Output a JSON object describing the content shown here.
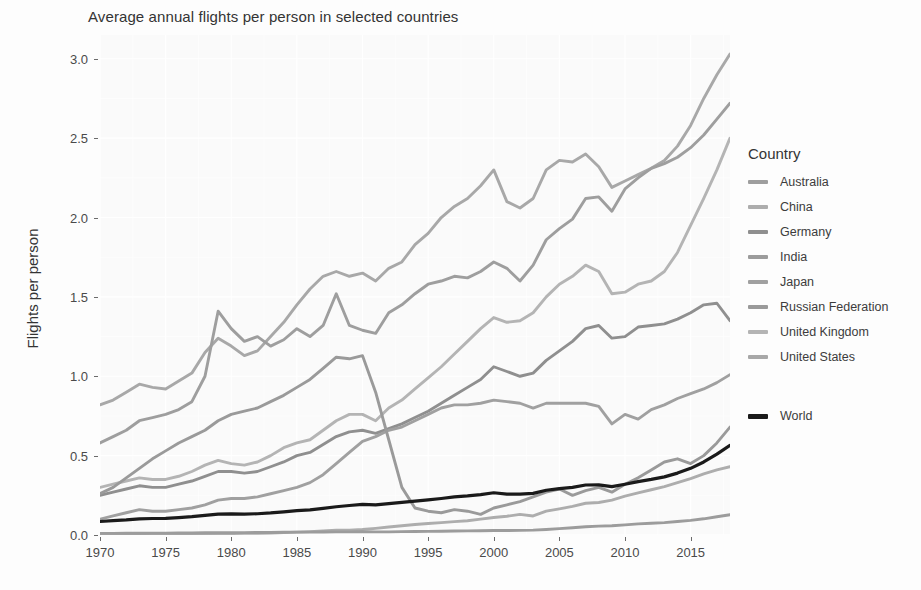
{
  "chart_data": {
    "type": "line",
    "title": "Average annual flights per person in selected countries",
    "xlabel": "",
    "ylabel": "Flights per person",
    "xlim": [
      1970,
      2018
    ],
    "ylim": [
      0.0,
      3.15
    ],
    "x_ticks": [
      1970,
      1975,
      1980,
      1985,
      1990,
      1995,
      2000,
      2005,
      2010,
      2015
    ],
    "y_ticks": [
      "0.0",
      "0.5",
      "1.0",
      "1.5",
      "2.0",
      "2.5",
      "3.0"
    ],
    "grid": true,
    "legend_position": "right",
    "legend_title": "Country",
    "x": [
      1970,
      1971,
      1972,
      1973,
      1974,
      1975,
      1976,
      1977,
      1978,
      1979,
      1980,
      1981,
      1982,
      1983,
      1984,
      1985,
      1986,
      1987,
      1988,
      1989,
      1990,
      1991,
      1992,
      1993,
      1994,
      1995,
      1996,
      1997,
      1998,
      1999,
      2000,
      2001,
      2002,
      2003,
      2004,
      2005,
      2006,
      2007,
      2008,
      2009,
      2010,
      2011,
      2012,
      2013,
      2014,
      2015,
      2016,
      2017,
      2018
    ],
    "series": [
      {
        "name": "United States",
        "color": "#a8a8a8",
        "values": [
          0.82,
          0.85,
          0.9,
          0.95,
          0.93,
          0.92,
          0.97,
          1.02,
          1.15,
          1.24,
          1.19,
          1.13,
          1.16,
          1.25,
          1.34,
          1.45,
          1.55,
          1.63,
          1.66,
          1.63,
          1.65,
          1.6,
          1.68,
          1.72,
          1.83,
          1.9,
          2.0,
          2.07,
          2.12,
          2.2,
          2.3,
          2.1,
          2.06,
          2.12,
          2.3,
          2.36,
          2.35,
          2.4,
          2.32,
          2.19,
          2.23,
          2.27,
          2.31,
          2.36,
          2.45,
          2.58,
          2.75,
          2.9,
          3.03
        ]
      },
      {
        "name": "Australia",
        "color": "#9e9e9e",
        "values": [
          0.58,
          0.62,
          0.66,
          0.72,
          0.74,
          0.76,
          0.79,
          0.84,
          1.0,
          1.41,
          1.3,
          1.22,
          1.25,
          1.19,
          1.23,
          1.3,
          1.25,
          1.32,
          1.52,
          1.32,
          1.29,
          1.27,
          1.4,
          1.45,
          1.52,
          1.58,
          1.6,
          1.63,
          1.62,
          1.66,
          1.72,
          1.68,
          1.6,
          1.7,
          1.86,
          1.93,
          1.99,
          2.12,
          2.13,
          2.04,
          2.18,
          2.25,
          2.31,
          2.34,
          2.38,
          2.44,
          2.52,
          2.62,
          2.72
        ]
      },
      {
        "name": "United Kingdom",
        "color": "#b4b4b4",
        "values": [
          0.3,
          0.32,
          0.34,
          0.36,
          0.35,
          0.35,
          0.37,
          0.4,
          0.44,
          0.47,
          0.45,
          0.44,
          0.46,
          0.5,
          0.55,
          0.58,
          0.6,
          0.66,
          0.72,
          0.76,
          0.76,
          0.72,
          0.8,
          0.85,
          0.92,
          0.99,
          1.06,
          1.14,
          1.22,
          1.3,
          1.37,
          1.34,
          1.35,
          1.4,
          1.5,
          1.58,
          1.63,
          1.7,
          1.66,
          1.52,
          1.53,
          1.58,
          1.6,
          1.66,
          1.78,
          1.95,
          2.12,
          2.3,
          2.5
        ]
      },
      {
        "name": "Germany",
        "color": "#8f8f8f",
        "values": [
          0.25,
          0.27,
          0.29,
          0.31,
          0.3,
          0.3,
          0.32,
          0.34,
          0.37,
          0.4,
          0.4,
          0.39,
          0.4,
          0.43,
          0.46,
          0.5,
          0.52,
          0.57,
          0.62,
          0.65,
          0.66,
          0.64,
          0.67,
          0.7,
          0.74,
          0.78,
          0.83,
          0.88,
          0.93,
          0.98,
          1.06,
          1.03,
          1.0,
          1.02,
          1.1,
          1.16,
          1.22,
          1.3,
          1.32,
          1.24,
          1.25,
          1.31,
          1.32,
          1.33,
          1.36,
          1.4,
          1.45,
          1.46,
          1.35
        ]
      },
      {
        "name": "Japan",
        "color": "#a0a0a0",
        "values": [
          0.1,
          0.12,
          0.14,
          0.16,
          0.15,
          0.15,
          0.16,
          0.17,
          0.19,
          0.22,
          0.23,
          0.23,
          0.24,
          0.26,
          0.28,
          0.3,
          0.33,
          0.38,
          0.45,
          0.52,
          0.59,
          0.62,
          0.66,
          0.68,
          0.72,
          0.76,
          0.8,
          0.82,
          0.82,
          0.83,
          0.85,
          0.84,
          0.83,
          0.8,
          0.83,
          0.83,
          0.83,
          0.83,
          0.81,
          0.7,
          0.76,
          0.73,
          0.79,
          0.82,
          0.86,
          0.89,
          0.92,
          0.96,
          1.01
        ]
      },
      {
        "name": "Russian Federation",
        "color": "#9a9a9a",
        "values": [
          0.26,
          0.3,
          0.36,
          0.42,
          0.48,
          0.53,
          0.58,
          0.62,
          0.66,
          0.72,
          0.76,
          0.78,
          0.8,
          0.84,
          0.88,
          0.93,
          0.98,
          1.05,
          1.12,
          1.11,
          1.13,
          0.9,
          0.6,
          0.3,
          0.17,
          0.15,
          0.14,
          0.16,
          0.15,
          0.13,
          0.17,
          0.19,
          0.21,
          0.24,
          0.27,
          0.29,
          0.25,
          0.28,
          0.3,
          0.27,
          0.32,
          0.36,
          0.41,
          0.46,
          0.48,
          0.45,
          0.5,
          0.58,
          0.68
        ]
      },
      {
        "name": "China",
        "color": "#adadad",
        "values": [
          0.002,
          0.002,
          0.003,
          0.003,
          0.004,
          0.004,
          0.005,
          0.006,
          0.007,
          0.008,
          0.009,
          0.01,
          0.011,
          0.013,
          0.015,
          0.018,
          0.021,
          0.025,
          0.03,
          0.03,
          0.035,
          0.042,
          0.05,
          0.058,
          0.066,
          0.072,
          0.078,
          0.084,
          0.09,
          0.1,
          0.11,
          0.118,
          0.13,
          0.12,
          0.15,
          0.165,
          0.18,
          0.2,
          0.205,
          0.22,
          0.245,
          0.265,
          0.285,
          0.305,
          0.33,
          0.355,
          0.385,
          0.41,
          0.43
        ]
      },
      {
        "name": "India",
        "color": "#9c9c9c",
        "values": [
          0.01,
          0.01,
          0.011,
          0.011,
          0.012,
          0.012,
          0.013,
          0.013,
          0.014,
          0.015,
          0.015,
          0.015,
          0.016,
          0.016,
          0.017,
          0.018,
          0.018,
          0.019,
          0.02,
          0.02,
          0.021,
          0.02,
          0.02,
          0.021,
          0.022,
          0.023,
          0.024,
          0.025,
          0.026,
          0.027,
          0.028,
          0.028,
          0.029,
          0.031,
          0.035,
          0.04,
          0.046,
          0.052,
          0.056,
          0.058,
          0.064,
          0.07,
          0.074,
          0.078,
          0.085,
          0.092,
          0.102,
          0.115,
          0.128
        ]
      },
      {
        "name": "World",
        "color": "#1a1a1a",
        "values": [
          0.085,
          0.09,
          0.095,
          0.102,
          0.104,
          0.105,
          0.11,
          0.116,
          0.124,
          0.132,
          0.133,
          0.132,
          0.134,
          0.139,
          0.146,
          0.153,
          0.158,
          0.168,
          0.178,
          0.186,
          0.193,
          0.19,
          0.198,
          0.205,
          0.213,
          0.221,
          0.23,
          0.24,
          0.246,
          0.254,
          0.266,
          0.258,
          0.258,
          0.262,
          0.282,
          0.292,
          0.3,
          0.315,
          0.316,
          0.305,
          0.32,
          0.336,
          0.35,
          0.366,
          0.39,
          0.42,
          0.46,
          0.51,
          0.565
        ]
      }
    ]
  },
  "legend": {
    "title": "Country",
    "items": [
      {
        "label": "Australia",
        "color": "#9e9e9e"
      },
      {
        "label": "China",
        "color": "#adadad"
      },
      {
        "label": "Germany",
        "color": "#8f8f8f"
      },
      {
        "label": "India",
        "color": "#9c9c9c"
      },
      {
        "label": "Japan",
        "color": "#a0a0a0"
      },
      {
        "label": "Russian Federation",
        "color": "#9a9a9a"
      },
      {
        "label": "United Kingdom",
        "color": "#b4b4b4"
      },
      {
        "label": "United States",
        "color": "#a8a8a8"
      }
    ],
    "world": {
      "label": "World",
      "color": "#1a1a1a"
    }
  },
  "axes": {
    "y_title": "Flights per person",
    "y_ticks": [
      "0.0",
      "0.5",
      "1.0",
      "1.5",
      "2.0",
      "2.5",
      "3.0"
    ],
    "x_ticks": [
      "1970",
      "1975",
      "1980",
      "1985",
      "1990",
      "1995",
      "2000",
      "2005",
      "2010",
      "2015"
    ]
  },
  "title": "Average annual flights per person in selected countries"
}
